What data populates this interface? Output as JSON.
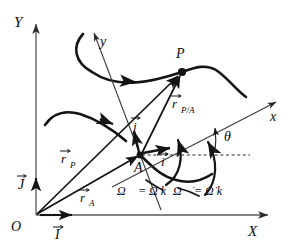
{
  "figure": {
    "type": "kinematics-vector-diagram",
    "stroke_color": "#141414",
    "thin_stroke_color": "#3a3a3a",
    "background": "#ffffff"
  },
  "global_frame": {
    "y_axis_label": "Y",
    "x_axis_label": "X",
    "origin_label": "O",
    "unit_vector_x": "I",
    "unit_vector_y": "J",
    "unit_vector_x_display": "I⃗",
    "unit_vector_y_display": "J⃗"
  },
  "body_frame": {
    "x_axis_label": "x",
    "y_axis_label": "y",
    "unit_vector_x": "i",
    "unit_vector_y": "j",
    "unit_vector_x_display": "i⃗",
    "unit_vector_y_display": "j⃗",
    "angle_label": "θ"
  },
  "points": [
    {
      "name": "O",
      "label": "O",
      "x": 36,
      "y": 215
    },
    {
      "name": "A",
      "label": "A",
      "x": 140,
      "y": 155
    },
    {
      "name": "P",
      "label": "P",
      "x": 182,
      "y": 72
    }
  ],
  "vectors": [
    {
      "name": "r_A",
      "label": "r⃗",
      "subscript": "A",
      "from": "O",
      "to": "A"
    },
    {
      "name": "r_P",
      "label": "r⃗",
      "subscript": "P",
      "from": "O",
      "to": "P"
    },
    {
      "name": "r_P_over_A",
      "label": "r⃗",
      "subscript": "P/A",
      "from": "A",
      "to": "P"
    }
  ],
  "equations": [
    {
      "name": "angular-velocity",
      "text": "Ω⃗ = Ω k⃗",
      "omega": "Ω",
      "k": "k"
    },
    {
      "name": "angular-acceleration",
      "text": "Ω⃗̇ = Ω̇ k⃗",
      "omega": "Ω",
      "k": "k"
    }
  ],
  "annotations": {
    "path_of_P": "path traced by P",
    "path_of_A": "path traced by A",
    "rotation_arc_1": "Ω rotation arc",
    "rotation_arc_2": "Ω̇ rotation arc",
    "dashed_reference_line": "horizontal reference through A"
  }
}
